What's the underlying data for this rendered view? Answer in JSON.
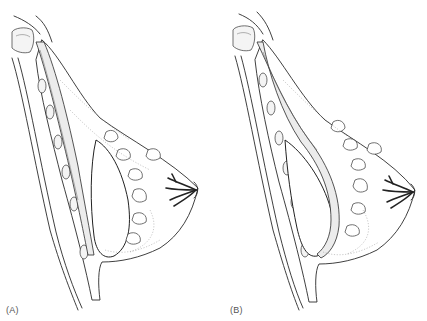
{
  "figure": {
    "type": "anatomical illustration",
    "panels": [
      {
        "id": "A",
        "label": "(A)",
        "implant_position": "subglandular (in front of pectoral muscle)"
      },
      {
        "id": "B",
        "label": "(B)",
        "implant_position": "submuscular (behind pectoral muscle)"
      }
    ],
    "colors": {
      "line": "#2a2a2a",
      "background": "#ffffff",
      "label": "#555555"
    }
  }
}
